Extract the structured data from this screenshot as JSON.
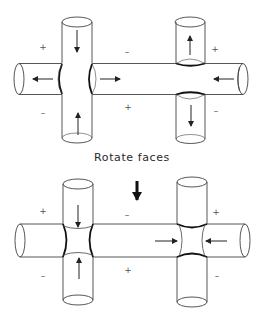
{
  "caption": "Rotate faces",
  "top_diagram": {
    "signs": [
      {
        "text": "+",
        "x": 43,
        "y": 47
      },
      {
        "text": "–",
        "x": 43,
        "y": 113
      },
      {
        "text": "–",
        "x": 127,
        "y": 52
      },
      {
        "text": "+",
        "x": 128,
        "y": 107
      },
      {
        "text": "+",
        "x": 215,
        "y": 49
      },
      {
        "text": "–",
        "x": 216,
        "y": 111
      }
    ]
  },
  "bottom_diagram": {
    "signs": [
      {
        "text": "+",
        "x": 43,
        "y": 211
      },
      {
        "text": "–",
        "x": 43,
        "y": 276
      },
      {
        "text": "–",
        "x": 127,
        "y": 215
      },
      {
        "text": "+",
        "x": 128,
        "y": 270
      },
      {
        "text": "+",
        "x": 216,
        "y": 212
      },
      {
        "text": "–",
        "x": 217,
        "y": 276
      }
    ]
  },
  "colors": {
    "line": "#444444",
    "face": "#111111",
    "text": "#2a2a2a"
  }
}
